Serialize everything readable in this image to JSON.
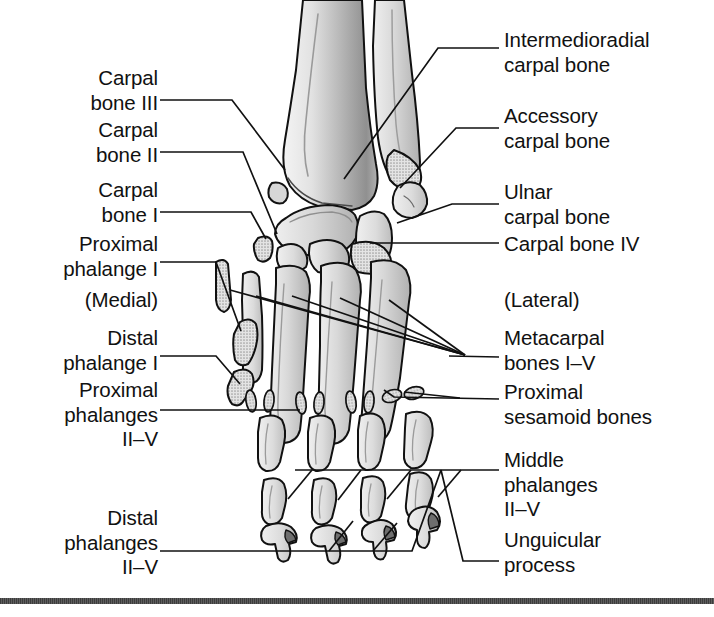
{
  "figure": {
    "background_color": "#ffffff",
    "line_color": "#111111",
    "bone_fill_light": "#e6e6e6",
    "bone_fill_mid": "#cfcfcf",
    "bone_fill_dark": "#b4b4b4",
    "bottom_rule_color": "#4a4a4a"
  },
  "labels_left": [
    {
      "id": "carpal-bone-iii",
      "text": "Carpal\nbone III",
      "x": 10,
      "y": 66,
      "width": 148
    },
    {
      "id": "carpal-bone-ii",
      "text": "Carpal\nbone II",
      "x": 10,
      "y": 118,
      "width": 148
    },
    {
      "id": "carpal-bone-i",
      "text": "Carpal\nbone I",
      "x": 10,
      "y": 178,
      "width": 148
    },
    {
      "id": "proximal-phalange-i",
      "text": "Proximal\nphalange I",
      "x": 10,
      "y": 232,
      "width": 148
    },
    {
      "id": "medial",
      "text": "(Medial)",
      "x": 10,
      "y": 288,
      "width": 148
    },
    {
      "id": "distal-phalange-i",
      "text": "Distal\nphalange I",
      "x": 10,
      "y": 326,
      "width": 148
    },
    {
      "id": "proximal-phalanges-ii-v",
      "text": "Proximal\nphalanges\nII–V",
      "x": 10,
      "y": 378,
      "width": 148
    },
    {
      "id": "distal-phalanges-ii-v",
      "text": "Distal\nphalanges\nII–V",
      "x": 10,
      "y": 506,
      "width": 148
    }
  ],
  "labels_right": [
    {
      "id": "intermedioradial-carpal-bone",
      "text": "Intermedioradial\ncarpal bone",
      "x": 504,
      "y": 28
    },
    {
      "id": "accessory-carpal-bone",
      "text": "Accessory\ncarpal bone",
      "x": 504,
      "y": 104
    },
    {
      "id": "ulnar-carpal-bone",
      "text": "Ulnar\ncarpal bone",
      "x": 504,
      "y": 180
    },
    {
      "id": "carpal-bone-iv",
      "text": "Carpal bone IV",
      "x": 504,
      "y": 232
    },
    {
      "id": "lateral",
      "text": "(Lateral)",
      "x": 504,
      "y": 288
    },
    {
      "id": "metacarpal-bones-i-v",
      "text": "Metacarpal\nbones I–V",
      "x": 504,
      "y": 326
    },
    {
      "id": "proximal-sesamoid-bones",
      "text": "Proximal\nsesamoid bones",
      "x": 504,
      "y": 380
    },
    {
      "id": "middle-phalanges-ii-v",
      "text": "Middle\nphalanges\nII–V",
      "x": 504,
      "y": 448
    },
    {
      "id": "unguicular-process",
      "text": "Unguicular\nprocess",
      "x": 504,
      "y": 528
    }
  ],
  "leader_lines": [
    {
      "id": "leader-carpal-bone-iii",
      "points": "160,100 232,100 285,170"
    },
    {
      "id": "leader-carpal-bone-ii",
      "points": "160,152 243,152 275,233"
    },
    {
      "id": "leader-carpal-bone-i",
      "points": "160,212 250,212 266,238"
    },
    {
      "id": "leader-proximal-phalange-i",
      "points": "160,262 216,262 240,330"
    },
    {
      "id": "leader-distal-phalange-i",
      "points": "160,356 216,356 240,383"
    },
    {
      "id": "leader-proximal-phalanges-ii-v",
      "points": "160,410 300,410"
    },
    {
      "id": "leader-distal-phalanges-ii-v",
      "points": "160,551 300,551"
    },
    {
      "id": "leader-intermedioradial",
      "points": "499,48 438,48 345,178"
    },
    {
      "id": "leader-accessory",
      "points": "499,128 455,128 398,186"
    },
    {
      "id": "leader-ulnar",
      "points": "499,204 450,204 400,222"
    },
    {
      "id": "leader-carpal-bone-iv",
      "points": "499,243 370,243"
    },
    {
      "id": "leader-metacarpal-1",
      "points": "465,355 276,293"
    },
    {
      "id": "leader-metacarpal-2",
      "points": "465,355 290,295"
    },
    {
      "id": "leader-metacarpal-3",
      "points": "465,355 307,296"
    },
    {
      "id": "leader-metacarpal-4",
      "points": "465,355 345,298"
    },
    {
      "id": "leader-metacarpal-5",
      "points": "465,355 385,300"
    },
    {
      "id": "leader-metacarpal-stub",
      "points": "499,359 447,357"
    },
    {
      "id": "leader-sesamoid-1",
      "points": "499,398 395,397 390,388"
    },
    {
      "id": "leader-sesamoid-2",
      "points": "455,397 412,391"
    },
    {
      "id": "leader-middle-phalanges-bracket",
      "points": "499,470 295,470"
    },
    {
      "id": "leader-middle-1",
      "points": "310,470 288,498"
    },
    {
      "id": "leader-middle-2",
      "points": "360,470 338,500"
    },
    {
      "id": "leader-middle-3",
      "points": "412,470 388,500"
    },
    {
      "id": "leader-middle-4",
      "points": "462,470 438,498"
    },
    {
      "id": "leader-distal-bracket",
      "points": "300,551 410,551 440,470"
    },
    {
      "id": "leader-distal-1",
      "points": "328,551 352,520"
    },
    {
      "id": "leader-distal-2",
      "points": "372,551 396,522"
    },
    {
      "id": "leader-unguicular",
      "points": "499,560 462,560 440,470"
    }
  ],
  "bone_groups": [
    {
      "id": "radius-shaft",
      "name": "radius",
      "count": 1
    },
    {
      "id": "ulna-shaft",
      "name": "ulna",
      "count": 1
    },
    {
      "id": "intermedioradial-carpal",
      "name": "intermedioradial carpal bone",
      "count": 1
    },
    {
      "id": "ulnar-carpal",
      "name": "ulnar carpal bone",
      "count": 1
    },
    {
      "id": "accessory-carpal",
      "name": "accessory carpal bone",
      "count": 1
    },
    {
      "id": "distal-carpal-row",
      "name": "carpal bones I-IV",
      "count": 4
    },
    {
      "id": "metacarpals",
      "name": "metacarpal bones I-V",
      "count": 5
    },
    {
      "id": "proximal-sesamoids",
      "name": "proximal sesamoid bones",
      "count": 8
    },
    {
      "id": "proximal-phalanges",
      "name": "proximal phalanges I-V",
      "count": 5
    },
    {
      "id": "middle-phalanges",
      "name": "middle phalanges II-V",
      "count": 4
    },
    {
      "id": "distal-phalanges",
      "name": "distal phalanges II-V",
      "count": 4
    }
  ]
}
